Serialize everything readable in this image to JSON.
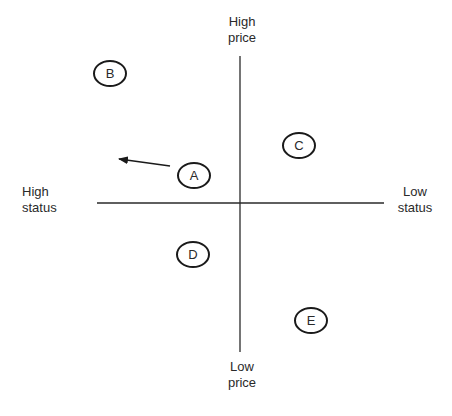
{
  "axes": {
    "top_label": [
      "High",
      "price"
    ],
    "bottom_label": [
      "Low",
      "price"
    ],
    "left_label": [
      "High",
      "status"
    ],
    "right_label": [
      "Low",
      "status"
    ]
  },
  "points": [
    {
      "id": "A",
      "label": "A",
      "status": -0.32,
      "price": 0.19
    },
    {
      "id": "B",
      "label": "B",
      "status": -0.9,
      "price": 0.88
    },
    {
      "id": "C",
      "label": "C",
      "status": 0.41,
      "price": 0.39
    },
    {
      "id": "D",
      "label": "D",
      "status": -0.33,
      "price": -0.34
    },
    {
      "id": "E",
      "label": "E",
      "status": 0.5,
      "price": -0.79
    }
  ],
  "arrow": {
    "from": "A",
    "direction": "toward high status, slightly higher price"
  }
}
